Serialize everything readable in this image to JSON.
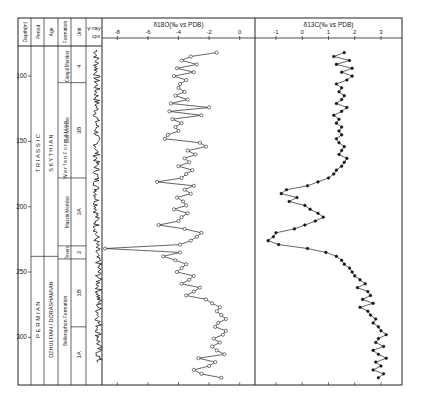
{
  "figure": {
    "columns": {
      "depth": "Depth(m)",
      "period": "Period",
      "age": "Age",
      "formation": "Formation",
      "unit": "Unit",
      "gamma": "γ-ray cps"
    },
    "depth_ticks": [
      {
        "value": 100,
        "label": "100"
      },
      {
        "value": 150,
        "label": "150"
      },
      {
        "value": 200,
        "label": "200"
      },
      {
        "value": 250,
        "label": "250"
      },
      {
        "value": 300,
        "label": "300"
      }
    ],
    "periods": [
      {
        "label": "T R I A S S I C",
        "top": 80,
        "bottom": 238
      },
      {
        "label": "P E R M I A N",
        "top": 238,
        "bottom": 335
      }
    ],
    "ages": [
      {
        "label": "S K Y T H I A N",
        "top": 80,
        "bottom": 238
      },
      {
        "label": "DZHULFIAN / DORASHAMIAN",
        "top": 238,
        "bottom": 335
      }
    ],
    "formations": [
      {
        "label": "W e r f e n   F o r m a t i o n",
        "top": 80,
        "bottom": 233
      },
      {
        "label": "Bellerophon   Formation",
        "top": 240,
        "bottom": 335
      }
    ],
    "members": [
      {
        "label": "Campil Member",
        "top": 80,
        "bottom": 105
      },
      {
        "label": "Seis Member",
        "top": 105,
        "bottom": 178
      },
      {
        "label": "Mazzin Member",
        "top": 178,
        "bottom": 230
      },
      {
        "label": "Tesero",
        "top": 230,
        "bottom": 240
      }
    ],
    "units": [
      {
        "label": "4",
        "top": 80,
        "bottom": 105
      },
      {
        "label": "3B",
        "top": 105,
        "bottom": 178
      },
      {
        "label": "3A",
        "top": 178,
        "bottom": 230
      },
      {
        "label": "2",
        "top": 230,
        "bottom": 240
      },
      {
        "label": "1B",
        "top": 240,
        "bottom": 292
      },
      {
        "label": "1A",
        "top": 292,
        "bottom": 335
      }
    ]
  },
  "chart_data": [
    {
      "type": "line",
      "title": "δ18O(‰ vs PDB)",
      "xlabel": "δ18O(‰ vs PDB)",
      "ylabel": "Depth (m)",
      "x_ticks": [
        -8,
        -6,
        -4,
        -2,
        0
      ],
      "xlim": [
        -9,
        1
      ],
      "ylim": [
        80,
        335
      ],
      "marker": "open-circle",
      "depth": [
        82,
        85,
        88,
        91,
        94,
        97,
        100,
        103,
        106,
        109,
        112,
        115,
        118,
        121,
        124,
        127,
        130,
        133,
        136,
        139,
        142,
        145,
        148,
        151,
        154,
        157,
        160,
        163,
        166,
        169,
        172,
        175,
        178,
        181,
        184,
        187,
        190,
        193,
        196,
        199,
        202,
        205,
        208,
        211,
        214,
        217,
        220,
        223,
        226,
        229,
        232,
        235,
        238,
        241,
        244,
        247,
        250,
        253,
        256,
        259,
        262,
        265,
        268,
        271,
        274,
        277,
        280,
        283,
        286,
        289,
        292,
        295,
        298,
        301,
        304,
        307,
        310,
        313,
        316,
        319,
        322,
        325,
        328,
        331
      ],
      "values": [
        -1.5,
        -3.2,
        -3.8,
        -2.8,
        -4.1,
        -3.0,
        -4.3,
        -3.5,
        -3.9,
        -4.0,
        -3.6,
        -4.2,
        -3.4,
        -4.5,
        -2.0,
        -4.6,
        -2.5,
        -4.4,
        -3.8,
        -4.2,
        -4.0,
        -4.7,
        -4.9,
        -2.6,
        -2.2,
        -3.4,
        -2.9,
        -3.6,
        -3.3,
        -4.0,
        -3.1,
        -3.5,
        -3.8,
        -5.4,
        -3.0,
        -3.6,
        -3.2,
        -4.1,
        -3.7,
        -3.5,
        -4.3,
        -3.4,
        -3.8,
        -4.0,
        -5.3,
        -3.6,
        -2.5,
        -2.8,
        -3.2,
        -3.9,
        -8.8,
        -3.9,
        -5.0,
        -4.2,
        -3.5,
        -3.8,
        -4.1,
        -3.0,
        -3.3,
        -3.8,
        -2.6,
        -3.0,
        -3.5,
        -2.2,
        -1.8,
        -1.3,
        -1.5,
        -1.2,
        -0.9,
        -1.4,
        -1.6,
        -0.9,
        -1.1,
        -1.7,
        -1.3,
        -1.8,
        -1.5,
        -1.0,
        -2.7,
        -1.6,
        -2.0,
        -3.0,
        -2.5,
        -1.2
      ]
    },
    {
      "type": "line",
      "title": "δ13C(‰ vs PDB)",
      "xlabel": "δ13C(‰ vs PDB)",
      "ylabel": "Depth (m)",
      "x_ticks": [
        -1,
        0,
        1,
        2,
        3
      ],
      "xlim": [
        -1.8,
        3.8
      ],
      "ylim": [
        80,
        335
      ],
      "marker": "filled-circle",
      "depth": [
        82,
        85,
        88,
        91,
        94,
        97,
        100,
        103,
        106,
        109,
        112,
        115,
        118,
        121,
        124,
        127,
        130,
        133,
        136,
        139,
        142,
        145,
        148,
        151,
        154,
        157,
        160,
        163,
        166,
        169,
        172,
        175,
        178,
        181,
        184,
        187,
        190,
        193,
        196,
        199,
        202,
        205,
        208,
        211,
        214,
        217,
        220,
        223,
        226,
        229,
        232,
        235,
        238,
        241,
        244,
        247,
        250,
        253,
        256,
        259,
        262,
        265,
        268,
        271,
        274,
        277,
        280,
        283,
        286,
        289,
        292,
        295,
        298,
        301,
        304,
        307,
        310,
        313,
        316,
        319,
        322,
        325,
        328,
        331
      ],
      "values": [
        1.6,
        1.2,
        1.8,
        1.3,
        1.9,
        1.5,
        1.9,
        1.7,
        1.3,
        1.5,
        1.4,
        1.6,
        1.5,
        1.3,
        1.7,
        1.5,
        1.2,
        1.4,
        1.3,
        1.5,
        1.4,
        1.5,
        1.3,
        1.4,
        1.6,
        1.5,
        1.4,
        1.7,
        1.6,
        1.5,
        1.3,
        1.2,
        1.0,
        0.6,
        0.2,
        -0.6,
        -0.8,
        -0.2,
        -0.5,
        0.1,
        0.3,
        0.6,
        0.8,
        0.5,
        0.1,
        -0.3,
        -1.0,
        -1.1,
        -1.3,
        -0.9,
        0.2,
        0.9,
        1.3,
        1.5,
        1.6,
        1.8,
        1.9,
        2.0,
        2.2,
        2.4,
        2.1,
        2.5,
        2.6,
        2.3,
        2.7,
        2.2,
        2.5,
        2.6,
        2.8,
        2.7,
        2.9,
        3.0,
        3.2,
        2.9,
        2.8,
        3.1,
        2.7,
        2.9,
        3.2,
        2.8,
        3.0,
        2.7,
        3.1,
        2.9
      ]
    }
  ]
}
